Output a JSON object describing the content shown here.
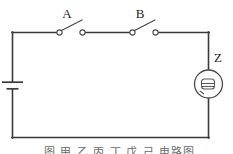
{
  "figure": {
    "type": "circuit-diagram",
    "background_color": "#ffffff",
    "wire_color": "#3a3a3a",
    "label_color": "#1f1f1f"
  },
  "labels": {
    "switch_a": "A",
    "switch_b": "B",
    "load_z": "Z"
  },
  "components": [
    {
      "id": "battery",
      "name": "battery",
      "symbol": "cell",
      "position": "left-side",
      "state": "source"
    },
    {
      "id": "switch-a",
      "name": "switch A",
      "label": "A",
      "symbol": "spst-switch",
      "position": "top-left",
      "state": "open"
    },
    {
      "id": "switch-b",
      "name": "switch B",
      "label": "B",
      "symbol": "spst-switch",
      "position": "top-right",
      "state": "open"
    },
    {
      "id": "load-z",
      "name": "component Z",
      "label": "Z",
      "symbol": "bell",
      "position": "right-side",
      "state": "inactive"
    }
  ],
  "caption": {
    "text": "图 甲 乙 丙 丁 戊 己 电路图",
    "visible": "partially-cut-off"
  }
}
